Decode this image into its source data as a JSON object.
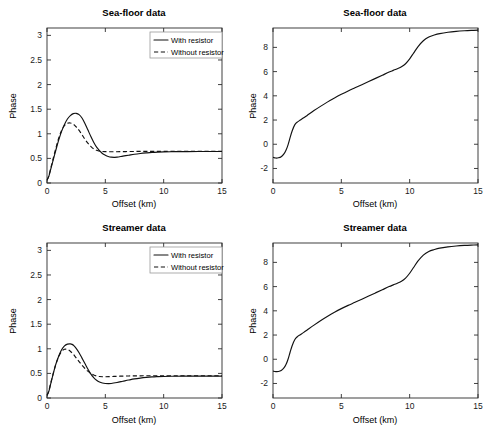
{
  "figure": {
    "width": 495,
    "height": 437,
    "background": "#ffffff",
    "line_color": "#111111",
    "axis_color": "#2b2b2b"
  },
  "chart_data": [
    {
      "id": "sea-floor-amplitude",
      "type": "line",
      "title": "Sea-floor data",
      "xlabel": "Offset (km)",
      "ylabel": "Phase",
      "xlim": [
        0,
        15
      ],
      "ylim": [
        0,
        3.15
      ],
      "xticks": [
        0,
        5,
        10,
        15
      ],
      "xticklabels": [
        "0",
        "5",
        "10",
        "15"
      ],
      "yticks": [
        0,
        0.5,
        1,
        1.5,
        2,
        2.5,
        3
      ],
      "yticklabels": [
        "0",
        "0.5",
        "1",
        "1.5",
        "2",
        "2.5",
        "3"
      ],
      "grid": false,
      "legend_position": "upper-right",
      "series": [
        {
          "name": "With resistor",
          "style": "solid",
          "x": [
            0.0,
            0.15,
            0.3,
            0.5,
            0.75,
            1.0,
            1.25,
            1.5,
            1.75,
            2.0,
            2.25,
            2.5,
            2.75,
            3.0,
            3.25,
            3.5,
            3.75,
            4.0,
            4.25,
            4.5,
            4.75,
            5.0,
            5.25,
            5.5,
            5.75,
            6.0,
            6.5,
            7.0,
            7.5,
            8.0,
            8.5,
            9.0,
            9.5,
            10.0,
            11.0,
            12.0,
            13.0,
            14.0,
            15.0
          ],
          "y": [
            0.06,
            0.13,
            0.26,
            0.44,
            0.66,
            0.87,
            1.05,
            1.19,
            1.3,
            1.37,
            1.41,
            1.415,
            1.39,
            1.32,
            1.21,
            1.08,
            0.95,
            0.83,
            0.73,
            0.66,
            0.6,
            0.565,
            0.54,
            0.525,
            0.522,
            0.525,
            0.545,
            0.565,
            0.585,
            0.6,
            0.612,
            0.622,
            0.628,
            0.632,
            0.637,
            0.639,
            0.64,
            0.641,
            0.641
          ]
        },
        {
          "name": "Without resistor",
          "style": "dashed",
          "x": [
            0.0,
            0.15,
            0.3,
            0.5,
            0.75,
            1.0,
            1.25,
            1.5,
            1.75,
            2.0,
            2.25,
            2.5,
            2.75,
            3.0,
            3.25,
            3.5,
            3.75,
            4.0,
            4.25,
            4.5,
            4.75,
            5.0,
            5.5,
            6.0,
            6.5,
            7.0,
            7.5,
            8.0,
            8.5,
            9.0,
            9.5,
            10.0,
            11.0,
            12.0,
            13.0,
            14.0,
            15.0
          ],
          "y": [
            0.06,
            0.14,
            0.28,
            0.47,
            0.7,
            0.91,
            1.07,
            1.17,
            1.215,
            1.22,
            1.195,
            1.14,
            1.07,
            0.98,
            0.89,
            0.81,
            0.745,
            0.695,
            0.665,
            0.648,
            0.64,
            0.637,
            0.635,
            0.636,
            0.638,
            0.64,
            0.641,
            0.642,
            0.643,
            0.643,
            0.644,
            0.644,
            0.644,
            0.644,
            0.644,
            0.644,
            0.644
          ]
        }
      ]
    },
    {
      "id": "sea-floor-phase",
      "type": "line",
      "title": "Sea-floor  data",
      "xlabel": "Offset (km)",
      "ylabel": "Phase",
      "xlim": [
        0,
        15
      ],
      "ylim": [
        -3.2,
        9.6
      ],
      "xticks": [
        0,
        5,
        10,
        15
      ],
      "xticklabels": [
        "0",
        "5",
        "10",
        "15"
      ],
      "yticks": [
        -2,
        0,
        2,
        4,
        6,
        8
      ],
      "yticklabels": [
        "-2",
        "0",
        "2",
        "4",
        "6",
        "8"
      ],
      "grid": false,
      "legend_position": "none",
      "series": [
        {
          "name": "With resistor",
          "style": "solid",
          "x": [
            0.0,
            0.2,
            0.4,
            0.6,
            0.8,
            0.95,
            1.1,
            1.25,
            1.4,
            1.6,
            1.8,
            2.0,
            2.25,
            2.5,
            3.0,
            3.5,
            4.0,
            4.5,
            5.0,
            5.5,
            6.0,
            6.5,
            7.0,
            7.5,
            8.0,
            8.5,
            8.8,
            9.1,
            9.4,
            9.7,
            10.0,
            10.3,
            10.6,
            11.0,
            11.4,
            11.8,
            12.2,
            12.8,
            13.4,
            14.0,
            14.5,
            15.0
          ],
          "y": [
            -1.08,
            -1.14,
            -1.12,
            -1.03,
            -0.8,
            -0.5,
            -0.05,
            0.55,
            1.1,
            1.62,
            1.85,
            2.0,
            2.18,
            2.38,
            2.78,
            3.15,
            3.5,
            3.82,
            4.12,
            4.4,
            4.66,
            4.92,
            5.18,
            5.44,
            5.7,
            5.96,
            6.1,
            6.24,
            6.4,
            6.65,
            7.05,
            7.55,
            8.05,
            8.55,
            8.85,
            9.02,
            9.14,
            9.25,
            9.32,
            9.37,
            9.4,
            9.42
          ]
        }
      ]
    },
    {
      "id": "streamer-amplitude",
      "type": "line",
      "title": "Streamer data",
      "xlabel": "Offset (km)",
      "ylabel": "Phase",
      "xlim": [
        0,
        15
      ],
      "ylim": [
        0,
        3.15
      ],
      "xticks": [
        0,
        5,
        10,
        15
      ],
      "xticklabels": [
        "0",
        "5",
        "10",
        "15"
      ],
      "yticks": [
        0,
        0.5,
        1,
        1.5,
        2,
        2.5,
        3
      ],
      "yticklabels": [
        "0",
        "0.5",
        "1",
        "1.5",
        "2",
        "2.5",
        "3"
      ],
      "grid": false,
      "legend_position": "upper-right",
      "series": [
        {
          "name": "With resistor",
          "style": "solid",
          "x": [
            0.0,
            0.15,
            0.3,
            0.5,
            0.75,
            1.0,
            1.25,
            1.5,
            1.75,
            2.0,
            2.15,
            2.3,
            2.5,
            2.75,
            3.0,
            3.25,
            3.5,
            3.75,
            4.0,
            4.25,
            4.5,
            4.75,
            5.0,
            5.25,
            5.5,
            6.0,
            6.5,
            7.0,
            7.5,
            8.0,
            8.5,
            9.0,
            9.5,
            10.0,
            11.0,
            12.0,
            13.0,
            14.0,
            15.0
          ],
          "y": [
            0.055,
            0.13,
            0.27,
            0.46,
            0.68,
            0.85,
            0.98,
            1.06,
            1.095,
            1.1,
            1.09,
            1.065,
            1.01,
            0.92,
            0.81,
            0.7,
            0.59,
            0.49,
            0.415,
            0.36,
            0.325,
            0.305,
            0.295,
            0.292,
            0.295,
            0.315,
            0.34,
            0.365,
            0.388,
            0.405,
            0.418,
            0.428,
            0.434,
            0.438,
            0.443,
            0.445,
            0.446,
            0.446,
            0.446
          ]
        },
        {
          "name": "Without resistor",
          "style": "dashed",
          "x": [
            0.0,
            0.15,
            0.3,
            0.5,
            0.75,
            1.0,
            1.25,
            1.5,
            1.75,
            2.0,
            2.25,
            2.5,
            2.75,
            3.0,
            3.25,
            3.5,
            3.75,
            4.0,
            4.25,
            4.5,
            4.75,
            5.0,
            5.5,
            6.0,
            6.5,
            7.0,
            7.5,
            8.0,
            8.5,
            9.0,
            9.5,
            10.0,
            11.0,
            12.0,
            13.0,
            14.0,
            15.0
          ],
          "y": [
            0.055,
            0.14,
            0.28,
            0.47,
            0.68,
            0.84,
            0.945,
            0.99,
            0.985,
            0.95,
            0.89,
            0.815,
            0.74,
            0.665,
            0.6,
            0.545,
            0.5,
            0.468,
            0.447,
            0.436,
            0.432,
            0.432,
            0.436,
            0.441,
            0.445,
            0.448,
            0.45,
            0.451,
            0.452,
            0.452,
            0.452,
            0.452,
            0.452,
            0.452,
            0.452,
            0.452,
            0.452
          ]
        }
      ]
    },
    {
      "id": "streamer-phase",
      "type": "line",
      "title": "Streamer data",
      "xlabel": "Offset (km)",
      "ylabel": "Phase",
      "xlim": [
        0,
        15
      ],
      "ylim": [
        -3.2,
        9.6
      ],
      "xticks": [
        0,
        5,
        10,
        15
      ],
      "xticklabels": [
        "0",
        "5",
        "10",
        "15"
      ],
      "yticks": [
        -2,
        0,
        2,
        4,
        6,
        8
      ],
      "yticklabels": [
        "-2",
        "0",
        "2",
        "4",
        "6",
        "8"
      ],
      "grid": false,
      "legend_position": "none",
      "series": [
        {
          "name": "With resistor",
          "style": "solid",
          "x": [
            0.0,
            0.2,
            0.4,
            0.6,
            0.8,
            0.95,
            1.1,
            1.25,
            1.4,
            1.6,
            1.8,
            2.0,
            2.25,
            2.5,
            3.0,
            3.5,
            4.0,
            4.5,
            5.0,
            5.5,
            6.0,
            6.5,
            7.0,
            7.5,
            8.0,
            8.5,
            8.8,
            9.1,
            9.4,
            9.7,
            10.0,
            10.3,
            10.6,
            11.0,
            11.4,
            11.8,
            12.2,
            12.8,
            13.4,
            14.0,
            14.5,
            15.0
          ],
          "y": [
            -0.98,
            -1.02,
            -1.01,
            -0.93,
            -0.72,
            -0.44,
            0.0,
            0.58,
            1.12,
            1.63,
            1.88,
            2.03,
            2.22,
            2.42,
            2.82,
            3.2,
            3.55,
            3.88,
            4.18,
            4.45,
            4.7,
            4.96,
            5.22,
            5.48,
            5.74,
            6.0,
            6.14,
            6.28,
            6.44,
            6.7,
            7.1,
            7.6,
            8.1,
            8.6,
            8.9,
            9.06,
            9.18,
            9.28,
            9.35,
            9.4,
            9.43,
            9.45
          ]
        }
      ]
    }
  ],
  "legend": {
    "entries": [
      {
        "label": "With resistor",
        "style": "solid"
      },
      {
        "label": "Without resistor",
        "style": "dashed"
      }
    ]
  }
}
